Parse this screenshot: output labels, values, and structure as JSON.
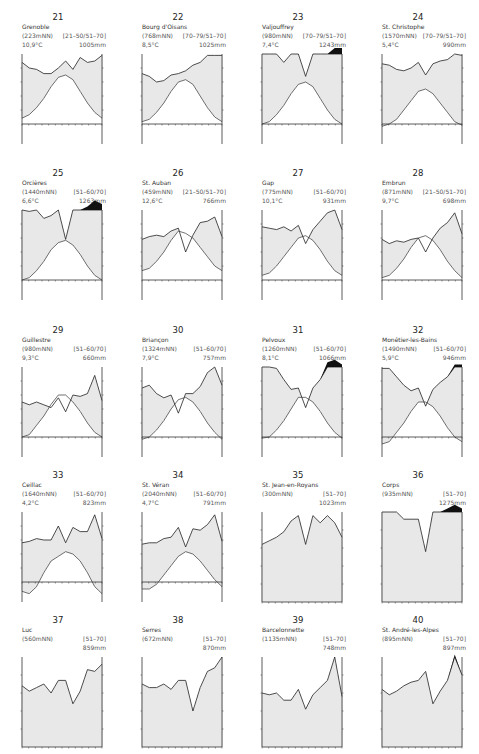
{
  "chart_data": [
    {
      "type": "line",
      "id": "21",
      "station": "Grenoble",
      "elevation": "(223mNN)",
      "period": "[21–50/51–70]",
      "mean_temp": "10,9°C",
      "annual_precip": "1005mm",
      "note": "normalized shape, 0-100 = bottom-top of panel",
      "months": [
        "J",
        "F",
        "M",
        "A",
        "M",
        "J",
        "J",
        "A",
        "S",
        "O",
        "N",
        "D"
      ],
      "precip": [
        88,
        80,
        78,
        72,
        72,
        80,
        90,
        78,
        95,
        88,
        90,
        98
      ],
      "temp": [
        5,
        8,
        14,
        22,
        32,
        40,
        42,
        38,
        28,
        18,
        10,
        5
      ],
      "cap": []
    },
    {
      "type": "line",
      "id": "22",
      "station": "Bourg d'Oisans",
      "elevation": "(768mNN)",
      "period": "[70–79/51–70]",
      "mean_temp": "8,5°C",
      "annual_precip": "1025mm",
      "months": [
        "J",
        "F",
        "M",
        "A",
        "M",
        "J",
        "J",
        "A",
        "S",
        "O",
        "N",
        "D"
      ],
      "precip": [
        72,
        68,
        60,
        62,
        70,
        72,
        76,
        84,
        88,
        98,
        98,
        98
      ],
      "temp": [
        2,
        4,
        10,
        18,
        28,
        36,
        38,
        34,
        24,
        14,
        6,
        2
      ],
      "cap": []
    },
    {
      "type": "line",
      "id": "23",
      "station": "Valjouffrey",
      "elevation": "(980mNN)",
      "period": "[70–79/51–70]",
      "mean_temp": "7,4°C",
      "annual_precip": "1243mm",
      "months": [
        "J",
        "F",
        "M",
        "A",
        "M",
        "J",
        "J",
        "A",
        "S",
        "O",
        "N",
        "D"
      ],
      "precip": [
        100,
        100,
        100,
        88,
        100,
        100,
        68,
        100,
        100,
        100,
        100,
        100
      ],
      "temp": [
        0,
        2,
        8,
        16,
        26,
        34,
        36,
        32,
        22,
        12,
        4,
        0
      ],
      "cap": [
        0,
        0,
        0,
        0,
        0,
        0,
        0,
        0,
        0,
        0,
        5,
        5
      ]
    },
    {
      "type": "line",
      "id": "24",
      "station": "St. Christophe",
      "elevation": "(1570mNN)",
      "period": "[70–79/51–70]",
      "mean_temp": "5,4°C",
      "annual_precip": "990mm",
      "months": [
        "J",
        "F",
        "M",
        "A",
        "M",
        "J",
        "J",
        "A",
        "S",
        "O",
        "N",
        "D"
      ],
      "precip": [
        86,
        84,
        78,
        76,
        80,
        88,
        70,
        86,
        90,
        92,
        100,
        98
      ],
      "temp": [
        -2,
        0,
        4,
        12,
        20,
        28,
        30,
        26,
        18,
        10,
        2,
        -1
      ],
      "cap": []
    },
    {
      "type": "line",
      "id": "25",
      "station": "Orcières",
      "elevation": "(1440mNN)",
      "period": "[51–60/70]",
      "mean_temp": "6,6°C",
      "annual_precip": "1263mm",
      "months": [
        "J",
        "F",
        "M",
        "A",
        "M",
        "J",
        "J",
        "A",
        "S",
        "O",
        "N",
        "D"
      ],
      "precip": [
        100,
        98,
        100,
        88,
        92,
        100,
        58,
        100,
        100,
        100,
        100,
        100
      ],
      "temp": [
        0,
        2,
        8,
        16,
        26,
        32,
        34,
        30,
        22,
        12,
        4,
        0
      ],
      "cap": [
        0,
        0,
        0,
        0,
        0,
        0,
        0,
        0,
        0,
        3,
        8,
        5
      ]
    },
    {
      "type": "line",
      "id": "26",
      "station": "St. Auban",
      "elevation": "(459mNN)",
      "period": "[21–50/51–70]",
      "mean_temp": "12,6°C",
      "annual_precip": "766mm",
      "months": [
        "J",
        "F",
        "M",
        "A",
        "M",
        "J",
        "J",
        "A",
        "S",
        "O",
        "N",
        "D"
      ],
      "precip": [
        58,
        62,
        64,
        62,
        70,
        74,
        40,
        64,
        82,
        84,
        90,
        62
      ],
      "temp": [
        8,
        10,
        16,
        24,
        34,
        42,
        40,
        36,
        28,
        20,
        12,
        8
      ],
      "cap": []
    },
    {
      "type": "line",
      "id": "27",
      "station": "Gap",
      "elevation": "(775mNN)",
      "period": "[51–60/70]",
      "mean_temp": "10,1°C",
      "annual_precip": "931mm",
      "months": [
        "J",
        "F",
        "M",
        "A",
        "M",
        "J",
        "J",
        "A",
        "S",
        "O",
        "N",
        "D"
      ],
      "precip": [
        76,
        74,
        72,
        76,
        70,
        78,
        52,
        72,
        84,
        96,
        100,
        72
      ],
      "temp": [
        4,
        6,
        12,
        20,
        28,
        36,
        38,
        34,
        26,
        16,
        8,
        4
      ],
      "cap": []
    },
    {
      "type": "line",
      "id": "28",
      "station": "Embrun",
      "elevation": "(871mNN)",
      "period": "[21–50/51–70]",
      "mean_temp": "9,7°C",
      "annual_precip": "698mm",
      "months": [
        "J",
        "F",
        "M",
        "A",
        "M",
        "J",
        "J",
        "A",
        "S",
        "O",
        "N",
        "D"
      ],
      "precip": [
        58,
        52,
        56,
        54,
        58,
        60,
        40,
        60,
        74,
        82,
        96,
        66
      ],
      "temp": [
        2,
        4,
        10,
        18,
        28,
        36,
        38,
        34,
        26,
        16,
        8,
        2
      ],
      "cap": []
    },
    {
      "type": "line",
      "id": "29",
      "station": "Guillestre",
      "elevation": "(980mNN)",
      "period": "[51–60/70]",
      "mean_temp": "9,3°C",
      "annual_precip": "660mm",
      "months": [
        "J",
        "F",
        "M",
        "A",
        "M",
        "J",
        "J",
        "A",
        "S",
        "O",
        "N",
        "D"
      ],
      "precip": [
        50,
        46,
        50,
        46,
        42,
        56,
        36,
        60,
        58,
        62,
        88,
        52
      ],
      "temp": [
        0,
        2,
        10,
        18,
        28,
        36,
        36,
        30,
        22,
        12,
        4,
        0
      ],
      "cap": []
    },
    {
      "type": "line",
      "id": "30",
      "station": "Briançon",
      "elevation": "(1324mNN)",
      "period": "[51–60/70]",
      "mean_temp": "7,9°C",
      "annual_precip": "757mm",
      "months": [
        "J",
        "F",
        "M",
        "A",
        "M",
        "J",
        "J",
        "A",
        "S",
        "O",
        "N",
        "D"
      ],
      "precip": [
        70,
        74,
        62,
        56,
        60,
        34,
        62,
        62,
        72,
        92,
        100,
        74
      ],
      "temp": [
        -2,
        0,
        6,
        14,
        24,
        32,
        34,
        30,
        22,
        12,
        4,
        -2
      ],
      "cap": []
    },
    {
      "type": "line",
      "id": "31",
      "station": "Pelvoux",
      "elevation": "(1260mNN)",
      "period": "[51–60/70]",
      "mean_temp": "8,1°C",
      "annual_precip": "1066mm",
      "months": [
        "J",
        "F",
        "M",
        "A",
        "M",
        "J",
        "J",
        "A",
        "S",
        "O",
        "N",
        "D"
      ],
      "precip": [
        100,
        100,
        98,
        82,
        68,
        70,
        42,
        70,
        82,
        100,
        100,
        100
      ],
      "temp": [
        -1,
        0,
        6,
        14,
        24,
        34,
        34,
        30,
        22,
        12,
        4,
        -1
      ],
      "cap": [
        0,
        0,
        0,
        0,
        0,
        0,
        0,
        0,
        0,
        4,
        6,
        2
      ]
    },
    {
      "type": "line",
      "id": "32",
      "station": "Monêtier-les-Bains",
      "elevation": "(1490mNN)",
      "period": "[51–60/70]",
      "mean_temp": "5,9°C",
      "annual_precip": "946mm",
      "months": [
        "J",
        "F",
        "M",
        "A",
        "M",
        "J",
        "J",
        "A",
        "S",
        "O",
        "N",
        "D"
      ],
      "precip": [
        98,
        98,
        86,
        74,
        66,
        70,
        44,
        68,
        78,
        86,
        100,
        100
      ],
      "temp": [
        -6,
        -4,
        4,
        12,
        22,
        30,
        30,
        26,
        18,
        8,
        0,
        -4
      ],
      "cap": [
        0,
        0,
        0,
        0,
        0,
        0,
        0,
        0,
        0,
        0,
        2,
        2
      ]
    },
    {
      "type": "line",
      "id": "33",
      "station": "Ceillac",
      "elevation": "(1640mNN)",
      "period": "[51–60/70]",
      "mean_temp": "4,2°C",
      "annual_precip": "823mm",
      "months": [
        "J",
        "F",
        "M",
        "A",
        "M",
        "J",
        "J",
        "A",
        "S",
        "O",
        "N",
        "D"
      ],
      "precip": [
        56,
        58,
        62,
        60,
        60,
        80,
        56,
        78,
        72,
        72,
        96,
        62
      ],
      "temp": [
        -8,
        -10,
        -4,
        8,
        18,
        22,
        26,
        24,
        18,
        8,
        -4,
        -10
      ],
      "cap": []
    },
    {
      "type": "line",
      "id": "34",
      "station": "St. Véran",
      "elevation": "(2040mNN)",
      "period": "[51–60/70]",
      "mean_temp": "4,7°C",
      "annual_precip": "791mm",
      "months": [
        "J",
        "F",
        "M",
        "A",
        "M",
        "J",
        "J",
        "A",
        "S",
        "O",
        "N",
        "D"
      ],
      "precip": [
        54,
        56,
        56,
        62,
        64,
        78,
        50,
        76,
        74,
        82,
        96,
        58
      ],
      "temp": [
        -6,
        -6,
        -2,
        6,
        14,
        22,
        26,
        24,
        18,
        10,
        2,
        -4
      ],
      "cap": []
    },
    {
      "type": "line",
      "id": "35",
      "station": "St. Jean-en-Royans",
      "elevation": "(300mNN)",
      "period": "[51–70]",
      "mean_temp": "",
      "annual_precip": "1023mm",
      "months": [
        "J",
        "F",
        "M",
        "A",
        "M",
        "J",
        "J",
        "A",
        "S",
        "O",
        "N",
        "D"
      ],
      "precip": [
        64,
        68,
        72,
        78,
        90,
        96,
        64,
        96,
        88,
        96,
        88,
        72
      ],
      "temp": [],
      "cap": []
    },
    {
      "type": "line",
      "id": "36",
      "station": "Corps",
      "elevation": "(935mNN)",
      "period": "[51–70]",
      "mean_temp": "",
      "annual_precip": "1275mm",
      "months": [
        "J",
        "F",
        "M",
        "A",
        "M",
        "J",
        "J",
        "A",
        "S",
        "O",
        "N",
        "D"
      ],
      "precip": [
        100,
        100,
        100,
        92,
        92,
        92,
        56,
        100,
        100,
        100,
        100,
        100
      ],
      "temp": [],
      "cap": [
        0,
        0,
        0,
        0,
        0,
        0,
        0,
        0,
        0,
        3,
        6,
        3
      ]
    },
    {
      "type": "line",
      "id": "37",
      "station": "Luc",
      "elevation": "(560mNN)",
      "period": "[51–70]",
      "mean_temp": "",
      "annual_precip": "859mm",
      "months": [
        "J",
        "F",
        "M",
        "A",
        "M",
        "J",
        "J",
        "A",
        "S",
        "O",
        "N",
        "D"
      ],
      "precip": [
        68,
        62,
        66,
        70,
        60,
        74,
        74,
        48,
        62,
        86,
        84,
        92
      ],
      "temp": [],
      "cap": []
    },
    {
      "type": "line",
      "id": "38",
      "station": "Serres",
      "elevation": "(672mNN)",
      "period": "[51–70]",
      "mean_temp": "",
      "annual_precip": "870mm",
      "months": [
        "J",
        "F",
        "M",
        "A",
        "M",
        "J",
        "J",
        "A",
        "S",
        "O",
        "N",
        "D"
      ],
      "precip": [
        70,
        66,
        66,
        70,
        64,
        74,
        74,
        40,
        66,
        84,
        88,
        100
      ],
      "temp": [],
      "cap": []
    },
    {
      "type": "line",
      "id": "39",
      "station": "Barcelonnette",
      "elevation": "(1135mNN)",
      "period": "[51–70]",
      "mean_temp": "",
      "annual_precip": "748mm",
      "months": [
        "J",
        "F",
        "M",
        "A",
        "M",
        "J",
        "J",
        "A",
        "S",
        "O",
        "N",
        "D"
      ],
      "precip": [
        60,
        58,
        60,
        52,
        52,
        64,
        42,
        58,
        66,
        74,
        100,
        56
      ],
      "temp": [],
      "cap": []
    },
    {
      "type": "line",
      "id": "40",
      "station": "St. André-les-Alpes",
      "elevation": "(895mNN)",
      "period": "[51–70]",
      "mean_temp": "",
      "annual_precip": "897mm",
      "months": [
        "J",
        "F",
        "M",
        "A",
        "M",
        "J",
        "J",
        "A",
        "S",
        "O",
        "N",
        "D"
      ],
      "precip": [
        64,
        58,
        62,
        68,
        72,
        74,
        84,
        48,
        62,
        74,
        100,
        80
      ],
      "temp": [],
      "cap": [
        0,
        0,
        0,
        0,
        0,
        0,
        0,
        0,
        0,
        0,
        2,
        0
      ]
    }
  ]
}
